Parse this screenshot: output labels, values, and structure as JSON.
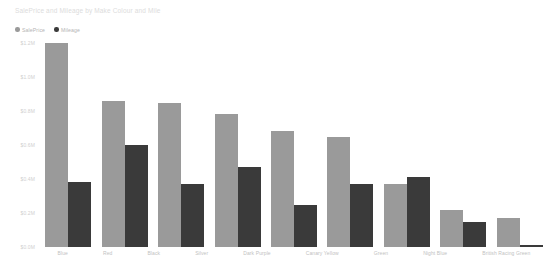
{
  "chart_data": {
    "type": "bar",
    "title": "SalePrice and Mileage by Make Colour and Mile",
    "categories": [
      "Blue",
      "Red",
      "Black",
      "Silver",
      "Dark Purple",
      "Canary Yellow",
      "Green",
      "Night Blue",
      "British Racing Green"
    ],
    "series": [
      {
        "name": "SalePrice",
        "color": "#9a9a9a",
        "values": [
          1.2,
          0.86,
          0.85,
          0.78,
          0.68,
          0.65,
          0.37,
          0.22,
          0.17
        ]
      },
      {
        "name": "Mileage",
        "color": "#3a3a3a",
        "values": [
          0.38,
          0.6,
          0.37,
          0.47,
          0.25,
          0.37,
          0.41,
          0.15,
          0.01
        ]
      }
    ],
    "ylabel": "",
    "xlabel": "",
    "ylim": [
      0.0,
      1.2
    ],
    "ytick_labels": [
      "$1.2M",
      "$1.0M",
      "$0.8M",
      "$0.6M",
      "$0.4M",
      "$0.2M",
      "$0.0M"
    ],
    "ytick_values": [
      1.2,
      1.0,
      0.8,
      0.6,
      0.4,
      0.2,
      0.0
    ],
    "grid": false,
    "legend_position": "top-left"
  }
}
